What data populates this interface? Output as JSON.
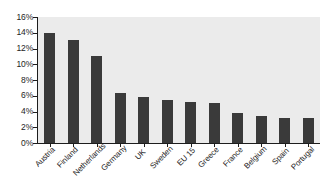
{
  "chart_data": {
    "type": "bar",
    "title": "",
    "subtitle": "",
    "xlabel": "",
    "ylabel": "",
    "categories": [
      "Austria",
      "Finland",
      "Netherlands",
      "Germany",
      "UK",
      "Sweden",
      "EU 15",
      "Greece",
      "France",
      "Belgium",
      "Spain",
      "Portugal"
    ],
    "values": [
      14.0,
      13.1,
      11.0,
      6.3,
      5.8,
      5.4,
      5.2,
      5.1,
      3.8,
      3.4,
      3.2,
      3.2
    ],
    "value_format": "percent",
    "ylim": [
      0,
      16
    ],
    "ytick_labels": [
      "0%",
      "2%",
      "4%",
      "6%",
      "8%",
      "10%",
      "12%",
      "14%",
      "16%"
    ],
    "ytick_values": [
      0,
      2,
      4,
      6,
      8,
      10,
      12,
      14,
      16
    ],
    "grid": false,
    "legend": null,
    "legend_position": "none",
    "annotations": [],
    "colors": {
      "bar_fill": "#3a3a3a",
      "plot_background": "#ebebeb",
      "figure_background": "#ffffff",
      "axis": "#1d1d1d",
      "text": "#1d1d1d"
    },
    "xlabel_rotation_degrees": -45
  }
}
